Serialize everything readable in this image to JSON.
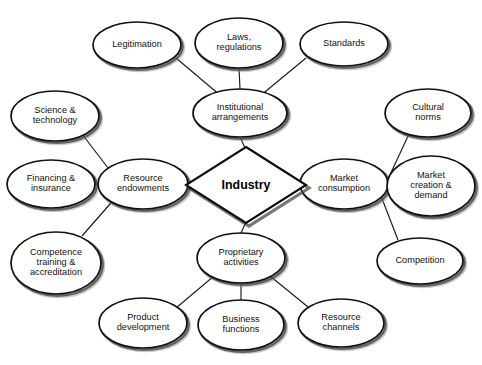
{
  "diagram": {
    "center": {
      "id": "industry",
      "label": "Industry",
      "shape": "diamond",
      "cx": 246,
      "cy": 185,
      "rx": 60,
      "ry": 38
    },
    "colors": {
      "node_fill": "#ffffff",
      "node_stroke": "#111111",
      "edge_stroke": "#1a1a1a",
      "text": "#111111",
      "background": "#ffffff"
    },
    "nodes": [
      {
        "id": "legitimation",
        "label": "Legitimation",
        "lines": [
          "Legitimation"
        ],
        "cx": 137,
        "cy": 45,
        "rx": 44,
        "ry": 23
      },
      {
        "id": "laws-regulations",
        "label": "Laws, regulations",
        "lines": [
          "Laws,",
          "regulations"
        ],
        "cx": 239,
        "cy": 43,
        "rx": 44,
        "ry": 25
      },
      {
        "id": "standards",
        "label": "Standards",
        "lines": [
          "Standards"
        ],
        "cx": 344,
        "cy": 44,
        "rx": 44,
        "ry": 22
      },
      {
        "id": "institutional-arrangements",
        "label": "Institutional arrangements",
        "lines": [
          "Institutional",
          "arrangements"
        ],
        "cx": 240,
        "cy": 113,
        "rx": 47,
        "ry": 24
      },
      {
        "id": "science-technology",
        "label": "Science & technology",
        "lines": [
          "Science &",
          "technology"
        ],
        "cx": 55,
        "cy": 116,
        "rx": 44,
        "ry": 25
      },
      {
        "id": "financing-insurance",
        "label": "Financing & insurance",
        "lines": [
          "Financing &",
          "insurance"
        ],
        "cx": 51,
        "cy": 184,
        "rx": 44,
        "ry": 24
      },
      {
        "id": "resource-endowments",
        "label": "Resource endowments",
        "lines": [
          "Resource",
          "endowments"
        ],
        "cx": 143,
        "cy": 184,
        "rx": 45,
        "ry": 25
      },
      {
        "id": "competence-training-accreditation",
        "label": "Competence training & accreditation",
        "lines": [
          "Competence",
          "training &",
          "accreditation"
        ],
        "cx": 56,
        "cy": 263,
        "rx": 45,
        "ry": 31
      },
      {
        "id": "market-consumption",
        "label": "Market consumption",
        "lines": [
          "Market",
          "consumption"
        ],
        "cx": 344,
        "cy": 184,
        "rx": 44,
        "ry": 25
      },
      {
        "id": "cultural-norms",
        "label": "Cultural norms",
        "lines": [
          "Cultural",
          "norms"
        ],
        "cx": 428,
        "cy": 113,
        "rx": 43,
        "ry": 24
      },
      {
        "id": "market-creation-demand",
        "label": "Market creation & demand",
        "lines": [
          "Market",
          "creation &",
          "demand"
        ],
        "cx": 431,
        "cy": 186,
        "rx": 44,
        "ry": 30
      },
      {
        "id": "competition",
        "label": "Competition",
        "lines": [
          "Competition"
        ],
        "cx": 420,
        "cy": 261,
        "rx": 43,
        "ry": 23
      },
      {
        "id": "proprietary-activities",
        "label": "Proprietary activities",
        "lines": [
          "Proprietary",
          "activities"
        ],
        "cx": 241,
        "cy": 258,
        "rx": 44,
        "ry": 25
      },
      {
        "id": "product-development",
        "label": "Product development",
        "lines": [
          "Product",
          "development"
        ],
        "cx": 143,
        "cy": 323,
        "rx": 44,
        "ry": 25
      },
      {
        "id": "business-functions",
        "label": "Business functions",
        "lines": [
          "Business",
          "functions"
        ],
        "cx": 241,
        "cy": 325,
        "rx": 43,
        "ry": 25
      },
      {
        "id": "resource-channels",
        "label": "Resource channels",
        "lines": [
          "Resource",
          "channels"
        ],
        "cx": 341,
        "cy": 323,
        "rx": 43,
        "ry": 24
      }
    ],
    "edges": [
      {
        "from": "legitimation",
        "to": "institutional-arrangements",
        "x1": 176,
        "y1": 58,
        "x2": 221,
        "y2": 96
      },
      {
        "from": "laws-regulations",
        "to": "institutional-arrangements",
        "x1": 239,
        "y1": 68,
        "x2": 240,
        "y2": 89
      },
      {
        "from": "standards",
        "to": "institutional-arrangements",
        "x1": 306,
        "y1": 58,
        "x2": 260,
        "y2": 96
      },
      {
        "from": "institutional-arrangements",
        "to": "industry",
        "x1": 240,
        "y1": 137,
        "x2": 246,
        "y2": 150
      },
      {
        "from": "science-technology",
        "to": "resource-endowments",
        "x1": 82,
        "y1": 134,
        "x2": 131,
        "y2": 198
      },
      {
        "from": "financing-insurance",
        "to": "resource-endowments",
        "x1": 95,
        "y1": 184,
        "x2": 98,
        "y2": 184
      },
      {
        "from": "competence-training-accreditation",
        "to": "resource-endowments",
        "x1": 82,
        "y1": 236,
        "x2": 117,
        "y2": 196
      },
      {
        "from": "resource-endowments",
        "to": "industry",
        "x1": 188,
        "y1": 184,
        "x2": 186,
        "y2": 185
      },
      {
        "from": "industry",
        "to": "market-consumption",
        "x1": 306,
        "y1": 185,
        "x2": 300,
        "y2": 184
      },
      {
        "from": "cultural-norms",
        "to": "market-consumption",
        "x1": 409,
        "y1": 134,
        "x2": 382,
        "y2": 192
      },
      {
        "from": "market-creation-demand",
        "to": "market-consumption",
        "x1": 387,
        "y1": 184,
        "x2": 388,
        "y2": 184
      },
      {
        "from": "competition",
        "to": "market-consumption",
        "x1": 398,
        "y1": 240,
        "x2": 381,
        "y2": 196
      },
      {
        "from": "industry",
        "to": "proprietary-activities",
        "x1": 246,
        "y1": 222,
        "x2": 241,
        "y2": 233
      },
      {
        "from": "proprietary-activities",
        "to": "product-development",
        "x1": 214,
        "y1": 276,
        "x2": 176,
        "y2": 308
      },
      {
        "from": "proprietary-activities",
        "to": "business-functions",
        "x1": 241,
        "y1": 283,
        "x2": 241,
        "y2": 300
      },
      {
        "from": "proprietary-activities",
        "to": "resource-channels",
        "x1": 270,
        "y1": 276,
        "x2": 308,
        "y2": 307
      }
    ]
  }
}
